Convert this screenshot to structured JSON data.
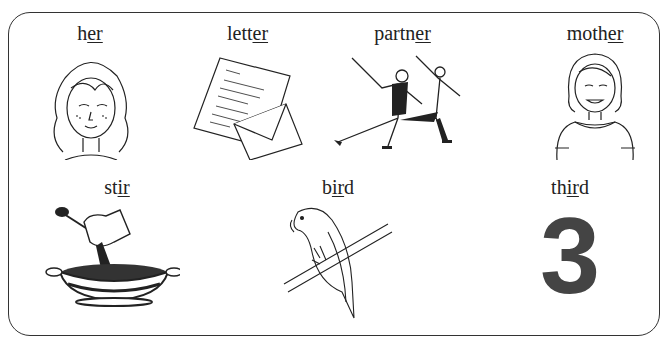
{
  "worksheet": {
    "rows": [
      {
        "items": [
          {
            "word": "her",
            "prefix": "h",
            "sound": "er",
            "suffix": "",
            "picture": "girl-face"
          },
          {
            "word": "letter",
            "prefix": "lett",
            "sound": "er",
            "suffix": "",
            "picture": "letter-and-envelope"
          },
          {
            "word": "partner",
            "prefix": "partn",
            "sound": "er",
            "suffix": "",
            "picture": "ice-skating-pair"
          },
          {
            "word": "mother",
            "prefix": "moth",
            "sound": "er",
            "suffix": "",
            "picture": "woman-smiling"
          }
        ]
      },
      {
        "items": [
          {
            "word": "stir",
            "prefix": "st",
            "sound": "ir",
            "suffix": "",
            "picture": "hand-stirring-bowl"
          },
          {
            "word": "bird",
            "prefix": "b",
            "sound": "ir",
            "suffix": "d",
            "picture": "parrot-on-branch"
          },
          {
            "word": "third",
            "prefix": "th",
            "sound": "ir",
            "suffix": "d",
            "picture": "number-three",
            "numeral": "3"
          }
        ]
      }
    ]
  }
}
